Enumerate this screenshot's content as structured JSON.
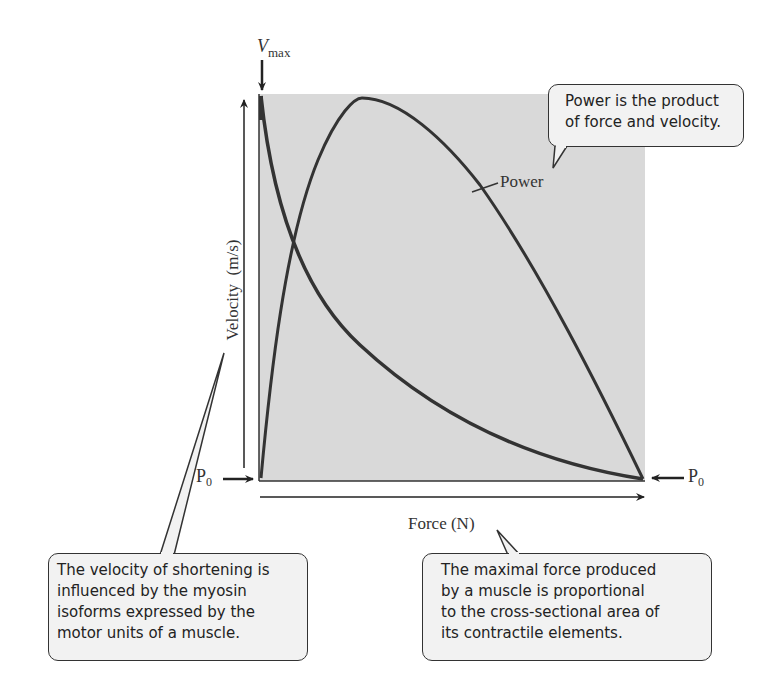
{
  "figure": {
    "y_axis_label": "Velocity  (m/s)",
    "x_axis_label": "Force (N)",
    "vmax_label": {
      "main": "V",
      "sub": "max"
    },
    "p0_left": {
      "main": "P",
      "sub": "0"
    },
    "p0_right": {
      "main": "P",
      "sub": "0"
    },
    "power_label": "Power",
    "colors": {
      "plot_bg": "#d9d9d9",
      "curve": "#333333",
      "callout_bg": "#f2f2f2",
      "callout_border": "#333333"
    }
  },
  "callouts": {
    "power": [
      "Power is the product",
      "of force and velocity."
    ],
    "velocity": [
      "The velocity of shortening is",
      "influenced by the myosin",
      "isoforms expressed by the",
      "motor units of a muscle."
    ],
    "force": [
      "The maximal force produced",
      "by a muscle is proportional",
      "to the cross-sectional area of",
      "its contractile elements."
    ]
  }
}
